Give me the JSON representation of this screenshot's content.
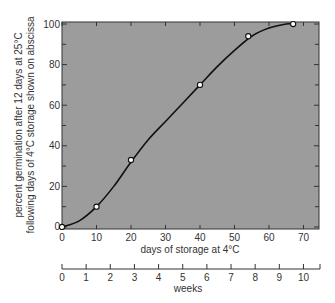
{
  "chart_data": {
    "type": "line",
    "title": "",
    "xlabel": "days of storage at 4°C",
    "ylabel": "percent germination after 12 days at 25°C following days of 4°C storage shown on abscissa",
    "ylabel_lines": [
      "percent germination after 12 days at 25°C",
      "following days of 4°C storage shown on abscissa"
    ],
    "secondary_xlabel": "weeks",
    "xlim": [
      0,
      74.5
    ],
    "ylim": [
      -1,
      101
    ],
    "x_ticks": [
      0,
      10,
      20,
      30,
      40,
      50,
      60,
      70
    ],
    "x_tick_labels": [
      "0",
      "10",
      "20",
      "30",
      "40",
      "50",
      "60",
      "70"
    ],
    "y_ticks": [
      0,
      20,
      40,
      60,
      80,
      100
    ],
    "y_tick_labels": [
      "0",
      "20",
      "40",
      "60",
      "80",
      "100"
    ],
    "y_minor_ticks": [
      10,
      30,
      50,
      70,
      90
    ],
    "secondary_x_ticks": [
      0,
      1,
      2,
      3,
      4,
      5,
      6,
      7,
      8,
      9,
      10
    ],
    "secondary_x_tick_labels": [
      "0",
      "1",
      "2",
      "3",
      "4",
      "5",
      "6",
      "7",
      "8",
      "9",
      "10"
    ],
    "grid": false,
    "legend": null,
    "series": [
      {
        "name": "germination",
        "marker": "open-circle",
        "x": [
          0,
          10,
          20,
          40,
          54,
          67
        ],
        "y": [
          0,
          10,
          33,
          70,
          94,
          100
        ]
      }
    ],
    "curve": {
      "x": [
        0,
        5,
        10,
        15,
        20,
        25,
        30,
        35,
        40,
        45,
        50,
        55,
        60,
        65,
        67
      ],
      "y": [
        0,
        3,
        10,
        20,
        32,
        43,
        52,
        61,
        70,
        79,
        87,
        94,
        98,
        100,
        100
      ]
    },
    "colors": {
      "plot_background": "#9c9c9c",
      "line": "#111111",
      "axis": "#333333",
      "marker_fill": "#ffffff"
    }
  }
}
